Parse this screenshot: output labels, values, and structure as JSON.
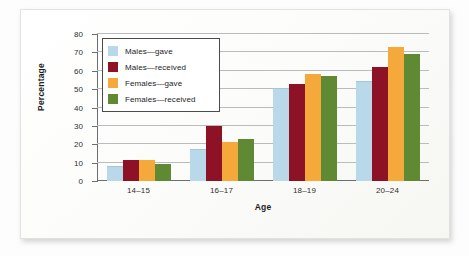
{
  "chart_data": {
    "type": "bar",
    "title": "",
    "xlabel": "Age",
    "ylabel": "Percentage",
    "categories": [
      "14–15",
      "16–17",
      "18–19",
      "20–24"
    ],
    "ylim": [
      0,
      80
    ],
    "yticks": [
      "0",
      "10",
      "20",
      "30",
      "40",
      "50",
      "60",
      "70",
      "80"
    ],
    "grid": true,
    "legend_position": "upper-left-inside",
    "series": [
      {
        "name": "Males—gave",
        "color": "#b9d8e9",
        "values": [
          7.5,
          17,
          50,
          54
        ]
      },
      {
        "name": "Males—received",
        "color": "#8d1225",
        "values": [
          11.5,
          30,
          53,
          62
        ]
      },
      {
        "name": "Females—gave",
        "color": "#f4a93a",
        "values": [
          11.5,
          21,
          58,
          73
        ]
      },
      {
        "name": "Females—received",
        "color": "#5f8a33",
        "values": [
          9.5,
          23,
          57,
          69
        ]
      }
    ]
  }
}
